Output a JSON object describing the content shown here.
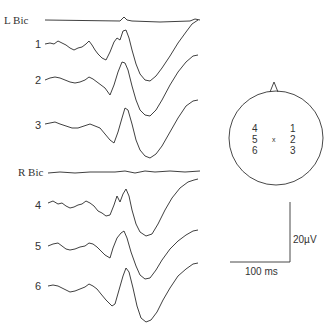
{
  "figure": {
    "left_group": {
      "label": "L Bic",
      "traces": [
        {
          "label": "1"
        },
        {
          "label": "2"
        },
        {
          "label": "3"
        }
      ]
    },
    "right_group": {
      "label": "R Bic",
      "traces": [
        {
          "label": "4"
        },
        {
          "label": "5"
        },
        {
          "label": "6"
        }
      ]
    },
    "head_map": {
      "left_electrodes": [
        "4",
        "5",
        "6"
      ],
      "right_electrodes": [
        "1",
        "2",
        "3"
      ],
      "center_marker": "x"
    },
    "scale_bar": {
      "voltage_label": "20µV",
      "time_label": "100 ms"
    }
  }
}
